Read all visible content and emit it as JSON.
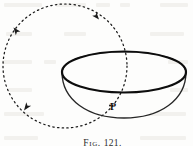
{
  "figure": {
    "caption_prefix": "Fig.",
    "caption_number": "121.",
    "caption_full": "Fig. 121.",
    "background_color": "#fdfdfc",
    "ink_color": "#1a1a1a",
    "ghost_color": "#f2f1ee"
  },
  "labels": {
    "point_p": "P"
  },
  "diagram_data": {
    "type": "line-drawing",
    "description": "A dotted circular path with direction arrowheads intersecting a hemispherical bowl drawn in perspective; the intersection point on the bowl rim-front is labelled P.",
    "elements": [
      {
        "name": "orbit-circle",
        "shape": "circle",
        "style": "dotted",
        "center": [
          65,
          66
        ],
        "radius": 62,
        "stroke": "#1a1a1a",
        "stroke_width": 1.2,
        "dash": "1.4 3.2"
      },
      {
        "name": "bowl-rim-ellipse",
        "shape": "ellipse",
        "style": "solid",
        "center": [
          124,
          72
        ],
        "rx": 62,
        "ry": 21,
        "stroke": "#101010",
        "stroke_width": 2.1
      },
      {
        "name": "bowl-body",
        "shape": "lower-hemisphere-arc",
        "style": "solid",
        "center": [
          124,
          72
        ],
        "rx": 62,
        "ry": 44,
        "stroke": "#222222",
        "stroke_width": 1.3
      },
      {
        "name": "arrowhead-upper-left",
        "shape": "arrowhead",
        "position": [
          13,
          27
        ],
        "direction_degrees": 230
      },
      {
        "name": "arrowhead-upper-right",
        "shape": "arrowhead",
        "position": [
          99,
          20
        ],
        "direction_degrees": 48
      },
      {
        "name": "arrowhead-lower-left",
        "shape": "arrowhead",
        "position": [
          24,
          110
        ],
        "direction_degrees": 128
      }
    ],
    "points": [
      {
        "name": "P",
        "label": "P",
        "coords": [
          110,
          106
        ]
      }
    ]
  }
}
